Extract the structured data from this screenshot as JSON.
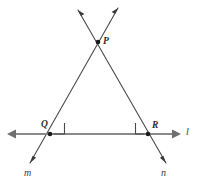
{
  "figure": {
    "kind": "geometry-diagram",
    "width": 199,
    "height": 184,
    "background_color": "#ffffff"
  },
  "style": {
    "line_color": "#4a4a4a",
    "base_line_color": "#8a8a8a",
    "point_color": "#1a1a1a",
    "label_color": "#2b2b2b",
    "line_width": 1.1,
    "base_line_width": 2.2
  },
  "points": [
    {
      "id": "P",
      "label": "P",
      "x": 98,
      "y": 42,
      "label_x": 103,
      "label_y": 37
    },
    {
      "id": "Q",
      "label": "Q",
      "x": 50,
      "y": 134,
      "label_x": 41,
      "label_y": 120
    },
    {
      "id": "R",
      "label": "R",
      "x": 148,
      "y": 134,
      "label_x": 152,
      "label_y": 121
    }
  ],
  "lines": [
    {
      "id": "l",
      "label": "l",
      "kind": "base-horizontal",
      "x1": 8,
      "y1": 134,
      "x2": 180,
      "y2": 134,
      "arrow_start": true,
      "arrow_end": true,
      "label_x": 186,
      "label_y": 127
    },
    {
      "id": "m",
      "label": "m",
      "kind": "transversal",
      "x1": 118,
      "y1": 8,
      "x2": 30,
      "y2": 163,
      "arrow_start": true,
      "arrow_end": true,
      "label_x": 24,
      "label_y": 168,
      "passes_through": [
        "P",
        "Q"
      ]
    },
    {
      "id": "n",
      "label": "n",
      "kind": "transversal",
      "x1": 78,
      "y1": 10,
      "x2": 166,
      "y2": 163,
      "arrow_start": true,
      "arrow_end": true,
      "label_x": 161,
      "label_y": 168,
      "passes_through": [
        "P",
        "R"
      ]
    }
  ],
  "right_angles": [
    {
      "id": "angle-Q",
      "at_point": "Q",
      "size": 11,
      "orientation": "upper-right",
      "measure_degrees": 90
    },
    {
      "id": "angle-R",
      "at_point": "R",
      "size": 11,
      "orientation": "upper-left",
      "measure_degrees": 90
    }
  ],
  "labels": {
    "P": "P",
    "Q": "Q",
    "R": "R",
    "l": "l",
    "m": "m",
    "n": "n"
  }
}
